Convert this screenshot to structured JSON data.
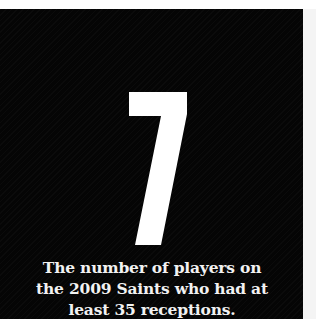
{
  "stat": {
    "value": "7",
    "caption_lines": [
      "The number of players on",
      "the 2009 Saints who had at",
      "least 35 receptions."
    ]
  },
  "colors": {
    "background": "#050505",
    "text": "#f2f2f2"
  }
}
